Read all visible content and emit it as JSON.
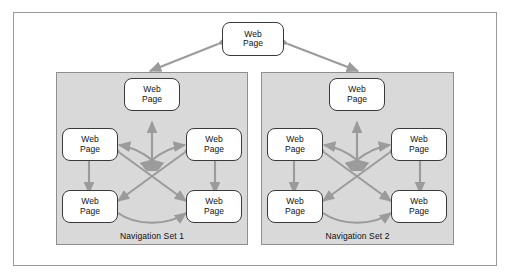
{
  "diagram": {
    "node_label_line1": "Web",
    "node_label_line2": "Page",
    "colors": {
      "panel_fill": "#d9d9d9",
      "panel_border": "#8f8f8f",
      "frame_border": "#9a9a9a",
      "node_border": "#3a3a3a",
      "node_fill": "#ffffff",
      "arrow": "#9b9b9b",
      "text": "#111111"
    },
    "top_node": {
      "line1": "Web",
      "line2": "Page"
    },
    "panels": [
      {
        "label": "Navigation Set 1",
        "nodes": [
          {
            "id": "top",
            "line1": "Web",
            "line2": "Page"
          },
          {
            "id": "mid-left",
            "line1": "Web",
            "line2": "Page"
          },
          {
            "id": "mid-right",
            "line1": "Web",
            "line2": "Page"
          },
          {
            "id": "bottom-left",
            "line1": "Web",
            "line2": "Page"
          },
          {
            "id": "bottom-right",
            "line1": "Web",
            "line2": "Page"
          }
        ]
      },
      {
        "label": "Navigation Set 2",
        "nodes": [
          {
            "id": "top",
            "line1": "Web",
            "line2": "Page"
          },
          {
            "id": "mid-left",
            "line1": "Web",
            "line2": "Page"
          },
          {
            "id": "mid-right",
            "line1": "Web",
            "line2": "Page"
          },
          {
            "id": "bottom-left",
            "line1": "Web",
            "line2": "Page"
          },
          {
            "id": "bottom-right",
            "line1": "Web",
            "line2": "Page"
          }
        ]
      }
    ]
  }
}
